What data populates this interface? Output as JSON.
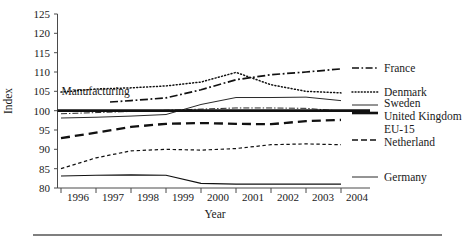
{
  "chart_data": {
    "type": "line",
    "title": "",
    "xlabel": "Year",
    "ylabel": "Index",
    "x": [
      1996,
      1997,
      1998,
      1999,
      2000,
      2001,
      2002,
      2003,
      2004
    ],
    "xtick_labels": [
      "1996",
      "1997",
      "1998",
      "1999",
      "2000",
      "2001",
      "2002",
      "2003",
      "2004"
    ],
    "ytick_labels": [
      "80",
      "85",
      "90",
      "95",
      "100",
      "105",
      "110",
      "115",
      "120",
      "125"
    ],
    "ylim": [
      80,
      125
    ],
    "ytick_step": 5,
    "grid": false,
    "legend_position": "right-outside",
    "reference_line": {
      "value": 100,
      "style": "thick-solid",
      "label": ""
    },
    "annotations": [
      {
        "text": "Manufacturing",
        "x": 1996.1,
        "y": 105.1
      }
    ],
    "series": [
      {
        "name": "France",
        "style": "dash-dot",
        "legend_label": "France",
        "values": [
          101.4,
          102.0,
          102.6,
          103.3,
          105.4,
          108.0,
          109.3,
          110.0,
          110.8
        ],
        "x_start": 1997.4
      },
      {
        "name": "Denmark",
        "style": "dotted",
        "legend_label": "Denmark",
        "values": [
          104.8,
          105.6,
          105.9,
          106.4,
          107.4,
          109.9,
          106.7,
          105.0,
          104.6
        ]
      },
      {
        "name": "Sweden",
        "style": "thin-solid",
        "legend_label": "Sweden",
        "values": [
          98.1,
          98.3,
          98.6,
          99.0,
          101.6,
          103.4,
          103.4,
          103.5,
          102.6
        ]
      },
      {
        "name": "United Kingdom",
        "style": "thick-dashed",
        "legend_label": "United Kingdom",
        "values": [
          92.9,
          94.3,
          95.8,
          96.6,
          96.8,
          96.6,
          96.5,
          97.3,
          97.6
        ]
      },
      {
        "name": "EU-15",
        "style": "thin-dash-dot",
        "legend_label": "EU-15",
        "values": [
          99.2,
          99.5,
          99.8,
          100.1,
          100.4,
          100.7,
          100.7,
          100.6,
          99.9
        ]
      },
      {
        "name": "Netherland",
        "style": "fine-dashed",
        "legend_label": "Netherland",
        "values": [
          85.0,
          87.8,
          89.6,
          90.0,
          89.8,
          90.2,
          91.2,
          91.4,
          91.2
        ]
      },
      {
        "name": "Germany",
        "style": "thin-solid-flat",
        "legend_label": "Germany",
        "values": [
          83.1,
          83.3,
          83.4,
          83.3,
          81.2,
          81.0,
          81.0,
          81.0,
          81.0
        ]
      }
    ],
    "legend_entries": [
      {
        "label": "France",
        "style": "dash-dot"
      },
      {
        "label": "Denmark",
        "style": "dotted"
      },
      {
        "label": "Sweden",
        "style": "thin-solid"
      },
      {
        "label": "United Kingdom",
        "style": "thick-solid"
      },
      {
        "label": "EU-15",
        "style": "thin-dash-dot"
      },
      {
        "label": "Netherland",
        "style": "fine-dashed"
      },
      {
        "label": "Germany",
        "style": "thin-solid"
      }
    ]
  },
  "colors": {
    "ink": "#111111",
    "axis": "#4a4a4a",
    "background": "#ffffff",
    "rule": "#555555"
  }
}
